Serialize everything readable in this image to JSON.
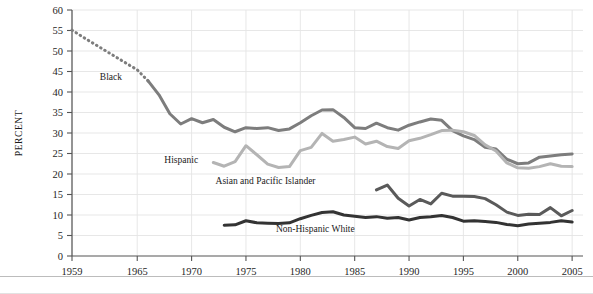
{
  "chart_data": {
    "type": "line",
    "title": "",
    "xlabel": "",
    "ylabel": "PERCENT",
    "xlim": [
      1959,
      2006
    ],
    "ylim": [
      0,
      60
    ],
    "grid": true,
    "legend_position": "inline-labels",
    "y_ticks": [
      0,
      5,
      10,
      15,
      20,
      25,
      30,
      35,
      40,
      45,
      50,
      55,
      60
    ],
    "y_tick_labels": [
      "0",
      "5",
      "10",
      "15",
      "20",
      "25",
      "30",
      "35",
      "40",
      "45",
      "50",
      "55",
      "60"
    ],
    "x_ticks": [
      1959,
      1965,
      1970,
      1975,
      1980,
      1985,
      1990,
      1995,
      2000,
      2005
    ],
    "x_tick_labels": [
      "1959",
      "1965",
      "1970",
      "1975",
      "1980",
      "1985",
      "1990",
      "1995",
      "2000",
      "2005"
    ],
    "series": [
      {
        "name": "Black",
        "label": "Black",
        "color": "#7d7d7d",
        "label_x": 1963.6,
        "label_y": 43.0,
        "dashed_until": 1966,
        "x": [
          1959,
          1960,
          1961,
          1962,
          1963,
          1964,
          1965,
          1966,
          1967,
          1968,
          1969,
          1970,
          1971,
          1972,
          1973,
          1974,
          1975,
          1976,
          1977,
          1978,
          1979,
          1980,
          1981,
          1982,
          1983,
          1984,
          1985,
          1986,
          1987,
          1988,
          1989,
          1990,
          1991,
          1992,
          1993,
          1994,
          1995,
          1996,
          1997,
          1998,
          1999,
          2000,
          2001,
          2002,
          2003,
          2004,
          2005
        ],
        "values": [
          55.1,
          53.4,
          51.8,
          50.2,
          48.6,
          47.0,
          45.4,
          42.7,
          39.3,
          34.7,
          32.2,
          33.5,
          32.5,
          33.3,
          31.4,
          30.3,
          31.3,
          31.1,
          31.3,
          30.6,
          31.0,
          32.5,
          34.2,
          35.6,
          35.7,
          33.8,
          31.3,
          31.1,
          32.4,
          31.3,
          30.7,
          31.9,
          32.7,
          33.4,
          33.1,
          30.6,
          29.3,
          28.4,
          26.5,
          26.1,
          23.6,
          22.5,
          22.7,
          24.1,
          24.4,
          24.7,
          24.9
        ]
      },
      {
        "name": "Hispanic",
        "label": "Hispanic",
        "color": "#b4b4b4",
        "label_x": 1970.6,
        "label_y": 22.8,
        "x": [
          1972,
          1973,
          1974,
          1975,
          1976,
          1977,
          1978,
          1979,
          1980,
          1981,
          1982,
          1983,
          1984,
          1985,
          1986,
          1987,
          1988,
          1989,
          1990,
          1991,
          1992,
          1993,
          1994,
          1995,
          1996,
          1997,
          1998,
          1999,
          2000,
          2001,
          2002,
          2003,
          2004,
          2005
        ],
        "values": [
          22.8,
          21.9,
          23.0,
          26.9,
          24.7,
          22.4,
          21.6,
          21.8,
          25.7,
          26.5,
          29.9,
          28.0,
          28.4,
          29.0,
          27.3,
          28.0,
          26.7,
          26.2,
          28.1,
          28.7,
          29.6,
          30.6,
          30.7,
          30.3,
          29.4,
          27.1,
          25.6,
          22.7,
          21.5,
          21.4,
          21.8,
          22.5,
          21.9,
          21.8
        ]
      },
      {
        "name": "Asian and Pacific Islander",
        "label": "Asian and Pacific Islander",
        "color": "#5a5a5a",
        "label_x": 1981.4,
        "label_y": 17.5,
        "x": [
          1987,
          1988,
          1989,
          1990,
          1991,
          1992,
          1993,
          1994,
          1995,
          1996,
          1997,
          1998,
          1999,
          2000,
          2001,
          2002,
          2003,
          2004,
          2005
        ],
        "values": [
          16.1,
          17.3,
          14.1,
          12.2,
          13.8,
          12.7,
          15.3,
          14.6,
          14.6,
          14.5,
          14.0,
          12.5,
          10.7,
          9.9,
          10.2,
          10.1,
          11.8,
          9.8,
          11.1
        ]
      },
      {
        "name": "Non-Hispanic White",
        "label": "Non-Hispanic White",
        "color": "#333333",
        "label_x": 1985.0,
        "label_y": 5.9,
        "x": [
          1973,
          1974,
          1975,
          1976,
          1977,
          1978,
          1979,
          1980,
          1981,
          1982,
          1983,
          1984,
          1985,
          1986,
          1987,
          1988,
          1989,
          1990,
          1991,
          1992,
          1993,
          1994,
          1995,
          1996,
          1997,
          1998,
          1999,
          2000,
          2001,
          2002,
          2003,
          2004,
          2005
        ],
        "values": [
          7.5,
          7.6,
          8.6,
          8.1,
          8.0,
          7.9,
          8.1,
          9.1,
          9.9,
          10.6,
          10.8,
          10.0,
          9.7,
          9.4,
          9.6,
          9.2,
          9.4,
          8.8,
          9.4,
          9.6,
          9.9,
          9.4,
          8.5,
          8.6,
          8.4,
          8.2,
          7.7,
          7.4,
          7.8,
          8.0,
          8.2,
          8.6,
          8.3
        ]
      }
    ]
  }
}
